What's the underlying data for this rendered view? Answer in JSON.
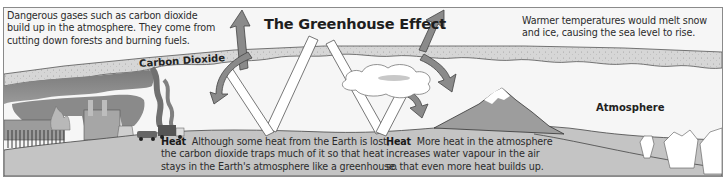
{
  "diagram": {
    "title": "The Greenhouse Effect",
    "captions": {
      "top_left": [
        "Dangerous gases such as carbon dioxide",
        "build up in the atmosphere. They come from",
        "cutting down forests and burning fuels."
      ],
      "top_right": [
        "Warmer temperatures would melt snow",
        "and ice, causing the sea level to rise."
      ],
      "bottom_middle": {
        "heading": "Heat",
        "lines": [
          "Although some heat from the Earth is lost,",
          "the carbon dioxide traps much of it so that heat",
          "stays in the Earth's atmosphere like a greenhouse."
        ]
      },
      "bottom_right": {
        "heading": "Heat",
        "lines": [
          "More heat in the atmosphere",
          "increases water vapour in the air",
          "so that even more heat builds up."
        ]
      }
    },
    "labels": {
      "carbon_dioxide": "Carbon Dioxide",
      "atmosphere": "Atmosphere"
    },
    "colors": {
      "background": "#f6f6f6",
      "co2_layer": "#d4d4d4",
      "ground": "#c2c2c2",
      "arrow_dark": "#7d7d7d",
      "arrow_light": "#ffffff",
      "smoke": "#8c8c8c"
    },
    "elements": [
      "factories",
      "burning-forest",
      "car",
      "truck",
      "sun-rays",
      "heat-arrows",
      "cloud",
      "mountain",
      "icebergs"
    ]
  }
}
